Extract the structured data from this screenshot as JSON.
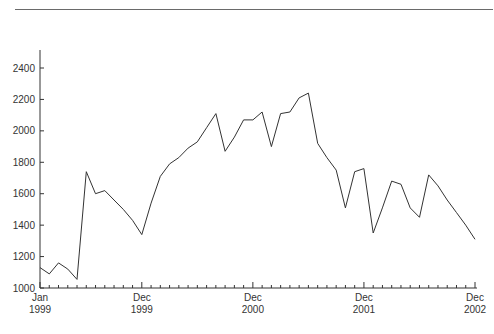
{
  "chart_data": {
    "type": "line",
    "title": "",
    "xlabel": "",
    "ylabel": "",
    "ylim": [
      1000,
      2400
    ],
    "yticks": [
      1000,
      1200,
      1400,
      1600,
      1800,
      2000,
      2200,
      2400
    ],
    "grid": false,
    "legend": null,
    "x_major_labels": [
      {
        "index": 0,
        "line1": "Jan",
        "line2": "1999"
      },
      {
        "index": 11,
        "line1": "Dec",
        "line2": "1999"
      },
      {
        "index": 23,
        "line1": "Dec",
        "line2": "2000"
      },
      {
        "index": 35,
        "line1": "Dec",
        "line2": "2001"
      },
      {
        "index": 47,
        "line1": "Dec",
        "line2": "2002"
      }
    ],
    "x": [
      "Jan 1999",
      "Feb 1999",
      "Mar 1999",
      "Apr 1999",
      "May 1999",
      "Jun 1999",
      "Jul 1999",
      "Aug 1999",
      "Sep 1999",
      "Oct 1999",
      "Nov 1999",
      "Dec 1999",
      "Jan 2000",
      "Feb 2000",
      "Mar 2000",
      "Apr 2000",
      "May 2000",
      "Jun 2000",
      "Jul 2000",
      "Aug 2000",
      "Sep 2000",
      "Oct 2000",
      "Nov 2000",
      "Dec 2000",
      "Jan 2001",
      "Feb 2001",
      "Mar 2001",
      "Apr 2001",
      "May 2001",
      "Jun 2001",
      "Jul 2001",
      "Aug 2001",
      "Sep 2001",
      "Oct 2001",
      "Nov 2001",
      "Dec 2001",
      "Jan 2002",
      "Feb 2002",
      "Mar 2002",
      "Apr 2002",
      "May 2002",
      "Jun 2002",
      "Jul 2002",
      "Aug 2002",
      "Sep 2002",
      "Oct 2002",
      "Nov 2002",
      "Dec 2002"
    ],
    "series": [
      {
        "name": "Monthly value",
        "color": "#333333",
        "values": [
          1130,
          1090,
          1160,
          1120,
          1055,
          1740,
          1600,
          1620,
          1560,
          1500,
          1430,
          1340,
          1540,
          1710,
          1790,
          1830,
          1890,
          1930,
          2020,
          2110,
          1870,
          1960,
          2070,
          2070,
          2120,
          1900,
          2110,
          2120,
          2210,
          2240,
          1920,
          1830,
          1750,
          1510,
          1740,
          1760,
          1350,
          1510,
          1680,
          1660,
          1510,
          1450,
          1720,
          1650,
          1560,
          1480,
          1400,
          1310
        ]
      }
    ]
  }
}
